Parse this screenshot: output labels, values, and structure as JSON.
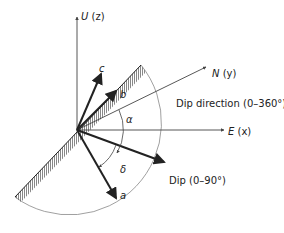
{
  "diagram": {
    "axes": {
      "up": {
        "var": "U",
        "coord": " (z)"
      },
      "north": {
        "var": "N",
        "coord": " (y)"
      },
      "east": {
        "var": "E",
        "coord": " (x)"
      }
    },
    "vectors": {
      "a": "a",
      "b": "b",
      "c": "c"
    },
    "angles": {
      "alpha": "α",
      "delta": "δ"
    },
    "annotations": {
      "dip_direction": "Dip direction (0–360°)",
      "dip": "Dip (0–90°)"
    },
    "colors": {
      "line": "#222222",
      "arc": "#888888"
    }
  }
}
